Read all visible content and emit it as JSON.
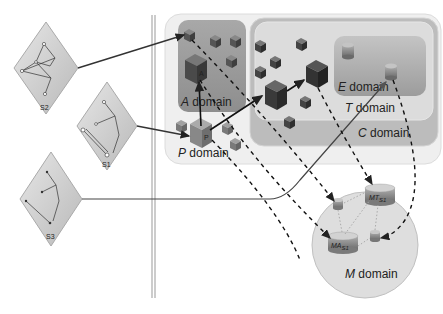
{
  "sources": [
    {
      "id": "S2",
      "label": "S2"
    },
    {
      "id": "S1",
      "label": "S1"
    },
    {
      "id": "S3",
      "label": "S3"
    }
  ],
  "domains": {
    "P": {
      "letter": "P",
      "word": "domain"
    },
    "A": {
      "letter": "A",
      "word": "domain"
    },
    "E": {
      "letter": "E",
      "word": "domain"
    },
    "T": {
      "letter": "T",
      "word": "domain"
    },
    "C": {
      "letter": "C",
      "word": "domain"
    },
    "M": {
      "letter": "M",
      "word": "domain"
    }
  },
  "model_labels": {
    "MT": {
      "base": "MT",
      "sub": "S1"
    },
    "MA": {
      "base": "MA",
      "sub": "S1"
    }
  },
  "cube_labels": {
    "P_main": "P",
    "P_main_sub": "S1",
    "A_main": "A",
    "A_main_sub": "S1",
    "T_main": "T",
    "T_main_sub": "S1"
  },
  "colors": {
    "outer_region": "#ececec",
    "A_region": "#9a9a9a",
    "C_region": "#b9b9b9",
    "T_region": "#d8d8d8",
    "E_region": "#a8a8a8",
    "M_circle": "#dcdcdc",
    "source_diamond": "#cfcfcf",
    "arrow": "#222222",
    "separator": "#aaaaaa"
  }
}
